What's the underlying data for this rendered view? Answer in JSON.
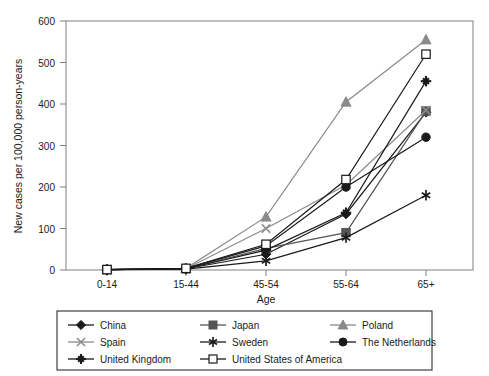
{
  "chart_data": {
    "type": "line",
    "title": "",
    "xlabel": "Age",
    "ylabel": "New cases per 100,000 person-years",
    "categories": [
      "0-14",
      "15-44",
      "45-54",
      "55-64",
      "65+"
    ],
    "ylim": [
      0,
      600
    ],
    "yticks": [
      0,
      100,
      200,
      300,
      400,
      500,
      600
    ],
    "grid": false,
    "legend_position": "bottom",
    "series": [
      {
        "name": "China",
        "marker": "filled-diamond",
        "color": "#1a1a1a",
        "values": [
          1,
          3,
          38,
          135,
          380
        ]
      },
      {
        "name": "Japan",
        "marker": "filled-square",
        "color": "#555555",
        "values": [
          1,
          3,
          52,
          90,
          383
        ]
      },
      {
        "name": "Poland",
        "marker": "filled-triangle",
        "color": "#8a8a8a",
        "values": [
          1,
          4,
          128,
          405,
          555
        ]
      },
      {
        "name": "Spain",
        "marker": "cross-x",
        "color": "#8a8a8a",
        "values": [
          1,
          3,
          100,
          205,
          385
        ]
      },
      {
        "name": "Sweden",
        "marker": "asterisk",
        "color": "#1a1a1a",
        "values": [
          1,
          2,
          22,
          78,
          180
        ]
      },
      {
        "name": "The Netherlands",
        "marker": "filled-circle",
        "color": "#1a1a1a",
        "values": [
          1,
          4,
          58,
          200,
          320
        ]
      },
      {
        "name": "United Kingdom",
        "marker": "plus",
        "color": "#1a1a1a",
        "values": [
          1,
          3,
          48,
          138,
          455
        ]
      },
      {
        "name": "United States of America",
        "marker": "open-square",
        "color": "#1a1a1a",
        "values": [
          1,
          4,
          62,
          218,
          520
        ]
      }
    ]
  },
  "legend": {
    "rows": [
      [
        "China",
        "Japan",
        "Poland"
      ],
      [
        "Spain",
        "Sweden",
        "The Netherlands"
      ],
      [
        "United Kingdom",
        "United States of America",
        ""
      ]
    ]
  },
  "axes": {
    "y_tick_600": "600",
    "y_tick_500": "500",
    "y_tick_400": "400",
    "y_tick_300": "300",
    "y_tick_200": "200",
    "y_tick_100": "100",
    "y_tick_0": "0",
    "x_tick_0": "0-14",
    "x_tick_1": "15-44",
    "x_tick_2": "45-54",
    "x_tick_3": "55-64",
    "x_tick_4": "65+",
    "x_title": "Age",
    "y_title": "New cases per 100,000 person-years"
  }
}
